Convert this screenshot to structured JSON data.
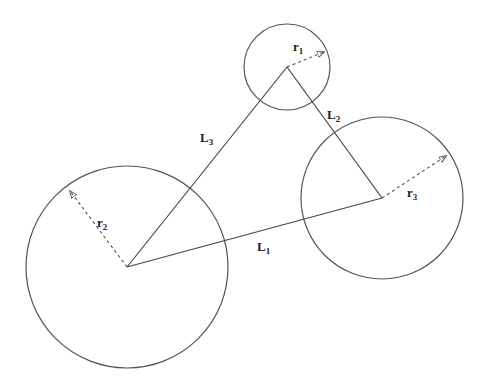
{
  "diagram": {
    "canvas": {
      "width": 484,
      "height": 388,
      "background": "#ffffff"
    },
    "circles": [
      {
        "id": "c1",
        "cx": 287,
        "cy": 67,
        "r": 43,
        "radius_label": {
          "main": "r",
          "sub": "1"
        }
      },
      {
        "id": "c2",
        "cx": 127,
        "cy": 267,
        "r": 101,
        "radius_label": {
          "main": "r",
          "sub": "2"
        }
      },
      {
        "id": "c3",
        "cx": 382,
        "cy": 198,
        "r": 81,
        "radius_label": {
          "main": "r",
          "sub": "3"
        }
      }
    ],
    "radii": [
      {
        "id": "r1",
        "from": [
          287,
          67
        ],
        "to": [
          324,
          52
        ],
        "label_pos": [
          293,
          51
        ]
      },
      {
        "id": "r2",
        "from": [
          127,
          267
        ],
        "to": [
          70,
          191
        ],
        "label_pos": [
          97,
          227
        ]
      },
      {
        "id": "r3",
        "from": [
          382,
          198
        ],
        "to": [
          446,
          156
        ],
        "label_pos": [
          407,
          197
        ]
      }
    ],
    "edges": [
      {
        "id": "L1",
        "from": [
          127,
          267
        ],
        "to": [
          382,
          198
        ],
        "label": {
          "main": "L",
          "sub": "1"
        },
        "label_pos": [
          257,
          251
        ]
      },
      {
        "id": "L2",
        "from": [
          287,
          67
        ],
        "to": [
          382,
          198
        ],
        "label": {
          "main": "L",
          "sub": "2"
        },
        "label_pos": [
          327,
          119
        ]
      },
      {
        "id": "L3",
        "from": [
          127,
          267
        ],
        "to": [
          287,
          67
        ],
        "label": {
          "main": "L",
          "sub": "3"
        },
        "label_pos": [
          200,
          142
        ]
      }
    ],
    "labels": {
      "r1_main": "r",
      "r1_sub": "1",
      "r2_main": "r",
      "r2_sub": "2",
      "r3_main": "r",
      "r3_sub": "3",
      "L1_main": "L",
      "L1_sub": "1",
      "L2_main": "L",
      "L2_sub": "2",
      "L3_main": "L",
      "L3_sub": "3"
    },
    "colors": {
      "stroke": "#555555",
      "text": "#222222"
    }
  }
}
